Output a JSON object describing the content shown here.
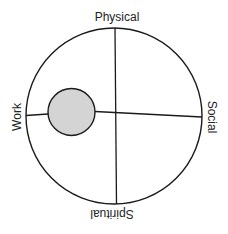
{
  "diagram": {
    "type": "life-balance-wheel",
    "labels": {
      "top": "Physical",
      "right": "Social",
      "bottom": "Spiritual",
      "left": "Work"
    },
    "colors": {
      "stroke": "#1a1a1a",
      "marker_fill": "#d4d4d4",
      "background": "#ffffff",
      "text": "#222222"
    },
    "marker": {
      "quadrant": "Work",
      "description": "filled gray circle positioned on the Work axis"
    }
  }
}
